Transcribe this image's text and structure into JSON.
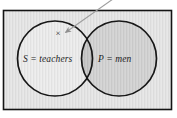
{
  "figure": {
    "kind": "venn-diagram",
    "caption_present": false,
    "frame": {
      "border_color": "#1a1a1a",
      "fill_color": "#e2e2e2",
      "page_color": "#ffffff"
    },
    "sets": [
      {
        "id": "S",
        "variable": "S",
        "equals": "=",
        "name": "teachers",
        "full_label": "S = teachers",
        "fill_color": "#e8e8e8",
        "stroke_color": "#1a1a1a",
        "position": "left"
      },
      {
        "id": "P",
        "variable": "P",
        "equals": "=",
        "name": "men",
        "full_label": "P = men",
        "fill_color": "#cdcdcd",
        "stroke_color": "#1a1a1a",
        "position": "right"
      }
    ],
    "intersection": {
      "fill_color": "#c2c2c2",
      "label": ""
    },
    "marks": [
      {
        "id": "x-mark",
        "glyph": "×",
        "region": "S-only",
        "color": "#2a2a2a"
      }
    ],
    "annotations": [
      {
        "id": "pointer-arrow",
        "type": "arrow",
        "from": "top-right-outside",
        "to": "x-mark",
        "color": "#9a9a9a",
        "text": ""
      }
    ]
  }
}
